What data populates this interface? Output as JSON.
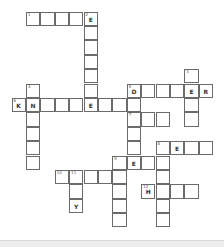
{
  "puzzle": {
    "cell_size": 14.4,
    "origin": {
      "x": 12,
      "y": 12
    },
    "cells": [
      {
        "r": 0,
        "c": 1,
        "num": "1",
        "letter": ""
      },
      {
        "r": 0,
        "c": 2,
        "num": "",
        "letter": ""
      },
      {
        "r": 0,
        "c": 3,
        "num": "",
        "letter": ""
      },
      {
        "r": 0,
        "c": 4,
        "num": "",
        "letter": ""
      },
      {
        "r": 0,
        "c": 5,
        "num": "2",
        "letter": "E"
      },
      {
        "r": 1,
        "c": 5,
        "num": "",
        "letter": ""
      },
      {
        "r": 2,
        "c": 5,
        "num": "",
        "letter": ""
      },
      {
        "r": 3,
        "c": 5,
        "num": "",
        "letter": ""
      },
      {
        "r": 4,
        "c": 5,
        "num": "",
        "letter": ""
      },
      {
        "r": 5,
        "c": 5,
        "num": "",
        "letter": ""
      },
      {
        "r": 4,
        "c": 12,
        "num": "3",
        "letter": ""
      },
      {
        "r": 5,
        "c": 12,
        "num": "",
        "letter": "E"
      },
      {
        "r": 6,
        "c": 12,
        "num": "",
        "letter": ""
      },
      {
        "r": 7,
        "c": 12,
        "num": "",
        "letter": ""
      },
      {
        "r": 5,
        "c": 1,
        "num": "4",
        "letter": ""
      },
      {
        "r": 7,
        "c": 1,
        "num": "",
        "letter": ""
      },
      {
        "r": 8,
        "c": 1,
        "num": "",
        "letter": ""
      },
      {
        "r": 9,
        "c": 1,
        "num": "",
        "letter": ""
      },
      {
        "r": 10,
        "c": 1,
        "num": "",
        "letter": ""
      },
      {
        "r": 5,
        "c": 8,
        "num": "5",
        "letter": "D"
      },
      {
        "r": 5,
        "c": 9,
        "num": "",
        "letter": ""
      },
      {
        "r": 5,
        "c": 10,
        "num": "",
        "letter": ""
      },
      {
        "r": 5,
        "c": 11,
        "num": "",
        "letter": ""
      },
      {
        "r": 5,
        "c": 13,
        "num": "",
        "letter": "R"
      },
      {
        "r": 6,
        "c": 0,
        "num": "6",
        "letter": "K"
      },
      {
        "r": 6,
        "c": 1,
        "num": "",
        "letter": "N"
      },
      {
        "r": 6,
        "c": 2,
        "num": "",
        "letter": ""
      },
      {
        "r": 6,
        "c": 3,
        "num": "",
        "letter": ""
      },
      {
        "r": 6,
        "c": 4,
        "num": "",
        "letter": ""
      },
      {
        "r": 6,
        "c": 5,
        "num": "",
        "letter": "E"
      },
      {
        "r": 6,
        "c": 6,
        "num": "",
        "letter": ""
      },
      {
        "r": 6,
        "c": 7,
        "num": "",
        "letter": ""
      },
      {
        "r": 6,
        "c": 8,
        "num": "",
        "letter": ""
      },
      {
        "r": 7,
        "c": 8,
        "num": "7",
        "letter": ""
      },
      {
        "r": 7,
        "c": 9,
        "num": "",
        "letter": ""
      },
      {
        "r": 7,
        "c": 10,
        "num": "",
        "letter": ""
      },
      {
        "r": 8,
        "c": 8,
        "num": "",
        "letter": ""
      },
      {
        "r": 9,
        "c": 8,
        "num": "",
        "letter": ""
      },
      {
        "r": 9,
        "c": 10,
        "num": "8",
        "letter": ""
      },
      {
        "r": 9,
        "c": 11,
        "num": "",
        "letter": "E"
      },
      {
        "r": 9,
        "c": 12,
        "num": "",
        "letter": ""
      },
      {
        "r": 9,
        "c": 13,
        "num": "",
        "letter": ""
      },
      {
        "r": 10,
        "c": 10,
        "num": "",
        "letter": ""
      },
      {
        "r": 11,
        "c": 10,
        "num": "",
        "letter": ""
      },
      {
        "r": 12,
        "c": 10,
        "num": "",
        "letter": ""
      },
      {
        "r": 13,
        "c": 10,
        "num": "",
        "letter": ""
      },
      {
        "r": 14,
        "c": 10,
        "num": "",
        "letter": ""
      },
      {
        "r": 10,
        "c": 7,
        "num": "9",
        "letter": ""
      },
      {
        "r": 10,
        "c": 8,
        "num": "",
        "letter": "E"
      },
      {
        "r": 10,
        "c": 9,
        "num": "",
        "letter": ""
      },
      {
        "r": 11,
        "c": 7,
        "num": "",
        "letter": ""
      },
      {
        "r": 12,
        "c": 7,
        "num": "",
        "letter": ""
      },
      {
        "r": 13,
        "c": 7,
        "num": "",
        "letter": ""
      },
      {
        "r": 14,
        "c": 7,
        "num": "",
        "letter": ""
      },
      {
        "r": 11,
        "c": 3,
        "num": "10",
        "letter": ""
      },
      {
        "r": 11,
        "c": 4,
        "num": "11",
        "letter": ""
      },
      {
        "r": 11,
        "c": 5,
        "num": "",
        "letter": ""
      },
      {
        "r": 11,
        "c": 6,
        "num": "",
        "letter": ""
      },
      {
        "r": 12,
        "c": 4,
        "num": "",
        "letter": ""
      },
      {
        "r": 13,
        "c": 4,
        "num": "",
        "letter": "Y"
      },
      {
        "r": 12,
        "c": 9,
        "num": "12",
        "letter": "H"
      },
      {
        "r": 12,
        "c": 11,
        "num": "",
        "letter": ""
      },
      {
        "r": 12,
        "c": 12,
        "num": "",
        "letter": ""
      }
    ]
  }
}
